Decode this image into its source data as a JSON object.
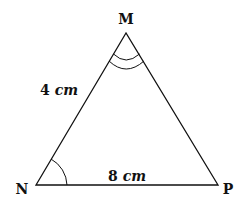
{
  "diagram": {
    "type": "triangle",
    "vertices": [
      {
        "label": "M",
        "x": 126,
        "y": 33
      },
      {
        "label": "N",
        "x": 36,
        "y": 185
      },
      {
        "label": "P",
        "x": 218,
        "y": 185
      }
    ],
    "sides": [
      {
        "from": "N",
        "to": "M",
        "value": "4",
        "unit": "cm"
      },
      {
        "from": "N",
        "to": "P",
        "value": "8",
        "unit": "cm"
      }
    ],
    "angle_marks": [
      {
        "vertex": "M",
        "arcs": 2
      },
      {
        "vertex": "N",
        "arcs": 1
      }
    ],
    "colors": {
      "stroke": "#111111",
      "background": "#ffffff"
    }
  }
}
